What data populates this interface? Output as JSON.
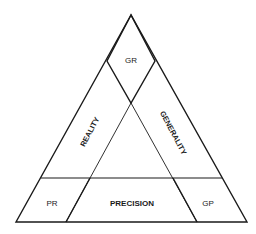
{
  "diagram": {
    "title": "",
    "regions": {
      "top": "GR",
      "left_side": "REALITY",
      "right_side": "GENERALITY",
      "bottom_left": "PR",
      "bottom_center": "PRECISION",
      "bottom_right": "GP"
    },
    "colors": {
      "line": "#1a1a1a",
      "background": "#ffffff"
    }
  }
}
